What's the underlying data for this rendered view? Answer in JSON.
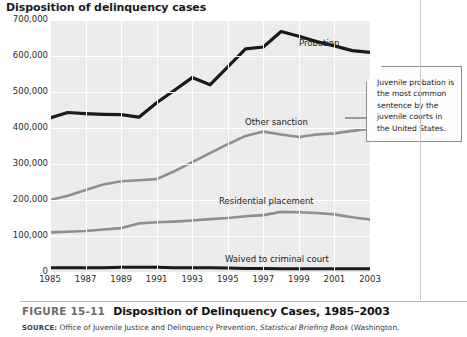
{
  "chart_title": "Disposition of delinquency cases",
  "caption": {
    "figure_number": "FIGURE 15-11",
    "figure_title": "Disposition of Delinquency Cases, 1985–2003",
    "source_label": "SOURCE:",
    "source_text_1": "Office of Juvenile Justice and Delinquency Prevention,",
    "source_italic": "Statistical Briefing Book",
    "source_text_2": "(Washington,"
  },
  "callout": {
    "text": "Juvenile probation is the most common sentence by the juvenile courts in the United States."
  },
  "series_labels": {
    "probation": "Probation",
    "other_sanction": "Other sanction",
    "residential_placement": "Residential placement",
    "waived": "Waived to criminal court"
  },
  "chart_data": {
    "type": "line",
    "title": "Disposition of delinquency cases",
    "xlabel": "",
    "ylabel": "",
    "xlim": [
      1985,
      2003
    ],
    "ylim": [
      0,
      700000
    ],
    "grid": true,
    "legend": "inline-labels",
    "ytick_labels": [
      "700,000",
      "600,000",
      "500,000",
      "400,000",
      "300,000",
      "200,000",
      "100,000",
      "0"
    ],
    "ytick_values": [
      700000,
      600000,
      500000,
      400000,
      300000,
      200000,
      100000,
      0
    ],
    "xtick_labels": [
      "1985",
      "1987",
      "1989",
      "1991",
      "1993",
      "1995",
      "1997",
      "1999",
      "2001",
      "2003"
    ],
    "xtick_values": [
      1985,
      1987,
      1989,
      1991,
      1993,
      1995,
      1997,
      1999,
      2001,
      2003
    ],
    "x": [
      1985,
      1986,
      1987,
      1988,
      1989,
      1990,
      1991,
      1992,
      1993,
      1994,
      1995,
      1996,
      1997,
      1998,
      1999,
      2000,
      2001,
      2002,
      2003
    ],
    "series": [
      {
        "name": "Probation",
        "color": "#1a1a1a",
        "values": [
          428000,
          443000,
          440000,
          438000,
          437000,
          430000,
          470000,
          505000,
          540000,
          520000,
          570000,
          620000,
          625000,
          668000,
          655000,
          640000,
          628000,
          615000,
          610000
        ]
      },
      {
        "name": "Other sanction",
        "color": "#8e8e8e",
        "values": [
          200000,
          212000,
          228000,
          243000,
          252000,
          255000,
          258000,
          280000,
          305000,
          330000,
          355000,
          378000,
          390000,
          382000,
          375000,
          382000,
          385000,
          392000,
          398000
        ]
      },
      {
        "name": "Residential placement",
        "color": "#8e8e8e",
        "values": [
          110000,
          112000,
          114000,
          118000,
          122000,
          135000,
          138000,
          140000,
          143000,
          147000,
          150000,
          155000,
          158000,
          167000,
          166000,
          164000,
          160000,
          152000,
          146000
        ]
      },
      {
        "name": "Waived to criminal court",
        "color": "#1a1a1a",
        "values": [
          12000,
          12000,
          12000,
          12000,
          13000,
          13000,
          13000,
          12000,
          12000,
          12000,
          11000,
          10000,
          10000,
          9000,
          9000,
          9000,
          9000,
          9000,
          9000
        ]
      }
    ]
  }
}
